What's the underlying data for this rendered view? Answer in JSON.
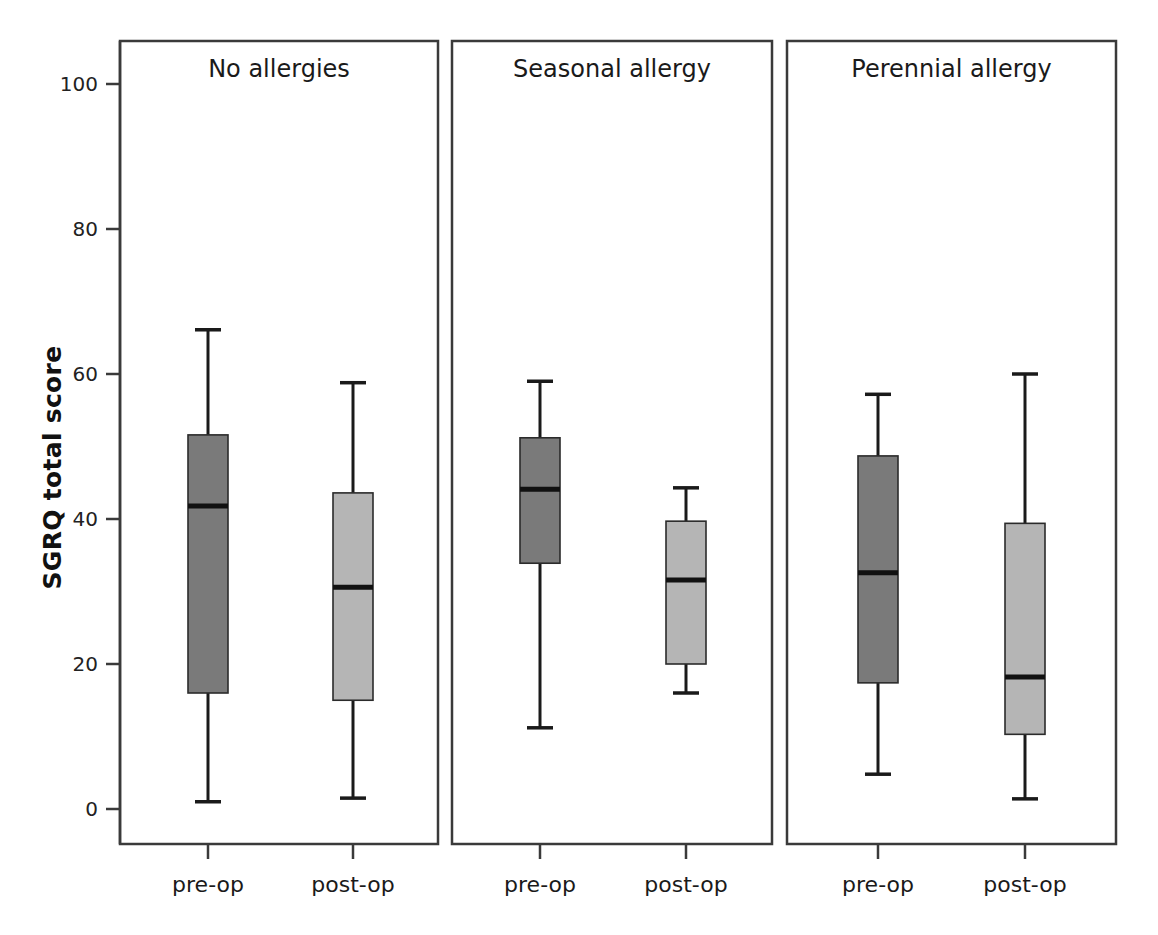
{
  "figure": {
    "ylabel": "SGRQ total score",
    "background": "#ffffff",
    "frame_color": "#3a3a3a",
    "line_color": "#1a1a1a"
  },
  "yaxis": {
    "ticks": [
      0,
      20,
      40,
      60,
      80,
      100
    ],
    "tick_labels": [
      "0",
      "20",
      "40",
      "60",
      "80",
      "100"
    ],
    "min": -1.5,
    "max": 103.0,
    "pixel_top": 84,
    "pixel_bottom": 809
  },
  "xaxis": {
    "categories": [
      "pre-op",
      "post-op"
    ]
  },
  "panels": [
    {
      "title": "No allergies",
      "x0": 120,
      "x1": 438,
      "boxes": [
        {
          "category": "pre-op",
          "fill": "#7a7a7a",
          "center": 208
        },
        {
          "category": "post-op",
          "fill": "#b5b5b5",
          "center": 353
        }
      ]
    },
    {
      "title": "Seasonal allergy",
      "x0": 452,
      "x1": 772,
      "boxes": [
        {
          "category": "pre-op",
          "fill": "#7a7a7a",
          "center": 540
        },
        {
          "category": "post-op",
          "fill": "#b5b5b5",
          "center": 686
        }
      ]
    },
    {
      "title": "Perennial allergy",
      "x0": 787,
      "x1": 1116,
      "boxes": [
        {
          "category": "pre-op",
          "fill": "#7a7a7a",
          "center": 878
        },
        {
          "category": "post-op",
          "fill": "#b5b5b5",
          "center": 1025
        }
      ]
    }
  ],
  "chart_data": {
    "type": "box",
    "title": "",
    "xlabel": "",
    "ylabel": "SGRQ total score",
    "ylim": [
      -1.5,
      103.0
    ],
    "yticks": [
      0,
      20,
      40,
      60,
      80,
      100
    ],
    "grid": false,
    "legend": "none",
    "panels": [
      "No allergies",
      "Seasonal allergy",
      "Perennial allergy"
    ],
    "categories": [
      "pre-op",
      "post-op"
    ],
    "series": [
      {
        "name": "pre-op",
        "fill": "#7a7a7a",
        "boxes": [
          {
            "panel": "No allergies",
            "whisker_low": 1.0,
            "q1": 16.0,
            "median": 41.8,
            "q3": 51.6,
            "whisker_high": 66.1
          },
          {
            "panel": "Seasonal allergy",
            "whisker_low": 11.2,
            "q1": 33.9,
            "median": 44.1,
            "q3": 51.2,
            "whisker_high": 59.0
          },
          {
            "panel": "Perennial allergy",
            "whisker_low": 4.8,
            "q1": 17.4,
            "median": 32.6,
            "q3": 48.7,
            "whisker_high": 57.2
          }
        ]
      },
      {
        "name": "post-op",
        "fill": "#b5b5b5",
        "boxes": [
          {
            "panel": "No allergies",
            "whisker_low": 1.5,
            "q1": 15.0,
            "median": 30.6,
            "q3": 43.6,
            "whisker_high": 58.8
          },
          {
            "panel": "Seasonal allergy",
            "whisker_low": 16.0,
            "q1": 20.0,
            "median": 31.6,
            "q3": 39.7,
            "whisker_high": 44.3
          },
          {
            "panel": "Perennial allergy",
            "whisker_low": 1.4,
            "q1": 10.3,
            "median": 18.2,
            "q3": 39.4,
            "whisker_high": 60.0
          }
        ]
      }
    ]
  }
}
